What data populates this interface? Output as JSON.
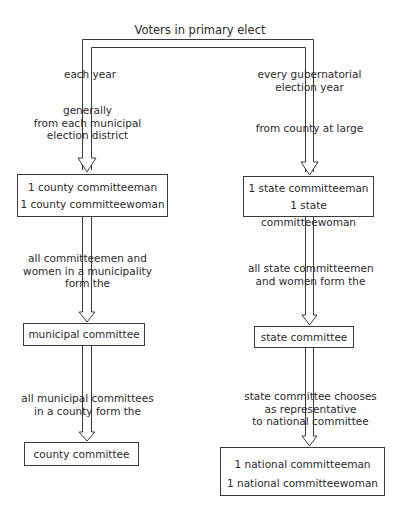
{
  "title": "Voters in primary elect",
  "left_branch": {
    "label_top": "each year",
    "label_source": [
      "generally",
      "from each municipal",
      "election district"
    ],
    "box1": [
      "1 county committeeman",
      "1 county committeewoman"
    ],
    "label_mid": [
      "all committeemen and",
      "women in a municipality",
      "form the"
    ],
    "box2": "municipal committee",
    "label_low": [
      "all municipal committees",
      "in a county form the"
    ],
    "box3": "county committee"
  },
  "right_branch": {
    "label_top": [
      "every gubernatorial",
      "election year"
    ],
    "label_source": "from county at large",
    "box1": [
      "1 state committeeman",
      "1 state committeewoman"
    ],
    "label_mid": [
      "all state committeemen",
      "and women form the"
    ],
    "box2": "state committee",
    "label_low": [
      "state committee chooses",
      "as representative",
      "to national committee"
    ],
    "box3": [
      "1 national committeeman",
      "1 national committeewoman"
    ]
  },
  "colors": {
    "line": "#3a3a3a",
    "text": "#2a2a2a",
    "background": "#ffffff"
  }
}
